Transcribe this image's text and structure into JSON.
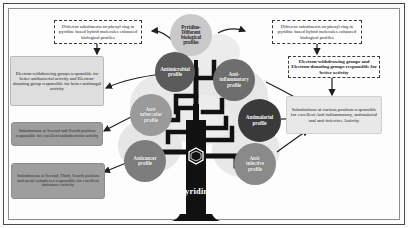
{
  "figure": {
    "type": "concept-tree-diagram",
    "subject": "Pyridine",
    "trunk_label": "Pyridine",
    "center_ring_icon": "pyridine-ring-icon"
  },
  "center_node": {
    "label": "Pyridine-\nDifferent\nbiological\nprofiles",
    "color": "#c9c9c9"
  },
  "nodes": [
    {
      "id": "antimicrobial",
      "label": "Antimicrobial\nprofile",
      "color": "#5b5b5b"
    },
    {
      "id": "anti-inflammatory",
      "label": "Anti-\ninflammatory\nprofile",
      "color": "#6e6e6e"
    },
    {
      "id": "anti-tubercular",
      "label": "Anti-\ntubercular\nprofile",
      "color": "#9a9a9a"
    },
    {
      "id": "antimalarial",
      "label": "Antimalarial\nprofile",
      "color": "#3a3a3a"
    },
    {
      "id": "anticancer",
      "label": "Anticancer\nprofile",
      "color": "#7d7d7d"
    },
    {
      "id": "anti-infective",
      "label": "Anti-\ninfective\nprofile",
      "color": "#8a8a8a"
    }
  ],
  "annotations": [
    {
      "id": "top-left-note",
      "style": "dashed",
      "text": "Different substituents on phenyl ring in pyridine based hybrid molecules enhanced biological profiles"
    },
    {
      "id": "top-right-note",
      "style": "dashed",
      "text": "Different substituents on phenyl ring in pyridine based hybrid molecules enhanced biological profiles"
    },
    {
      "id": "left-ewg-edg-note",
      "style": "solid-light",
      "text": "Electron-withdrawing groups responsible for better antibacterial activity and Electron-donating group responsible for better antifungal activity"
    },
    {
      "id": "right-ewg-edg-note",
      "style": "dashed",
      "text": "Electron-withdrawing groups and Electron-donating groups responsible for better activity"
    },
    {
      "id": "right-substitution-note",
      "style": "plain",
      "text": "Substitutions at various position responsible for excellent Anti-inflammatory, antimalarial and anti-infective Activity"
    },
    {
      "id": "left-antitubercular-note",
      "style": "solid-dark",
      "text": "Substitutions at Second and Fourth position responsible for excellent antitubercular activity"
    },
    {
      "id": "left-anticancer-note",
      "style": "solid-dark",
      "text": "Substitutions at Second, Third, Fourth position and metal complexes responsible for excellent anticancer activity"
    }
  ]
}
